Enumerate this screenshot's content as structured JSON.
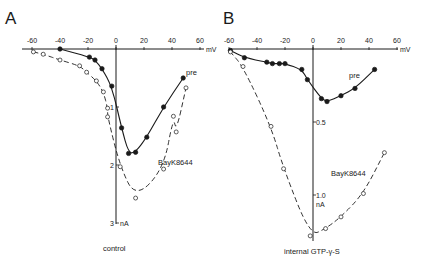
{
  "figure": {
    "panels": [
      {
        "letter": "A",
        "condition_label": "control",
        "x_unit": "mV",
        "y_unit": "nA",
        "x_ticks": [
          "-60",
          "-40",
          "-20",
          "0",
          "20",
          "40",
          "60"
        ],
        "y_ticks": [
          "1",
          "2",
          "3"
        ],
        "series_labels": {
          "pre": "pre",
          "bayk": "BayK8644"
        }
      },
      {
        "letter": "B",
        "condition_label": "internal GTP-γ-S",
        "x_unit": "mV",
        "y_unit": "nA",
        "x_ticks": [
          "-60",
          "-40",
          "-20",
          "0",
          "20",
          "40",
          "60"
        ],
        "y_ticks": [
          "0.5",
          "1.0"
        ],
        "series_labels": {
          "pre": "pre",
          "bayk": "BayK8644"
        }
      }
    ]
  },
  "chart_data": [
    {
      "type": "scatter",
      "panel": "A",
      "title": "control",
      "xlabel": "mV",
      "ylabel": "nA",
      "xlim": [
        -60,
        60
      ],
      "ylim": [
        0,
        3
      ],
      "y_inverted": true,
      "x_ticks": [
        -60,
        -40,
        -20,
        0,
        20,
        40,
        60
      ],
      "y_ticks": [
        1,
        2,
        3
      ],
      "grid": false,
      "series": [
        {
          "name": "pre",
          "marker": "filled-circle",
          "line": "solid",
          "x": [
            -40,
            -19,
            -15,
            -10,
            -3,
            4,
            9,
            14,
            22,
            34,
            48
          ],
          "y": [
            0.0,
            0.14,
            0.19,
            0.34,
            0.64,
            1.36,
            1.8,
            1.78,
            1.52,
            1.0,
            0.5
          ]
        },
        {
          "name": "BayK8644",
          "marker": "open-circle",
          "line": "dashed",
          "x": [
            -59,
            -52,
            -40,
            -26,
            -21,
            -14,
            -9,
            -6,
            -6,
            3,
            14,
            34,
            41,
            43,
            50
          ],
          "y": [
            0.05,
            0.09,
            0.19,
            0.29,
            0.4,
            0.55,
            0.74,
            1.02,
            1.17,
            2.03,
            2.57,
            2.07,
            1.16,
            1.43,
            0.67
          ]
        }
      ]
    },
    {
      "type": "scatter",
      "panel": "B",
      "title": "internal GTP-γ-S",
      "xlabel": "mV",
      "ylabel": "nA",
      "xlim": [
        -60,
        60
      ],
      "ylim": [
        0,
        1.3
      ],
      "y_inverted": true,
      "x_ticks": [
        -60,
        -40,
        -20,
        0,
        20,
        40,
        60
      ],
      "y_ticks": [
        0.5,
        1.0
      ],
      "grid": false,
      "series": [
        {
          "name": "pre",
          "marker": "filled-circle",
          "line": "solid",
          "x": [
            -59,
            -49,
            -33,
            -29,
            -24,
            -20,
            -8,
            -4,
            6,
            10,
            20,
            30,
            44
          ],
          "y": [
            0.01,
            0.06,
            0.09,
            0.1,
            0.1,
            0.1,
            0.14,
            0.21,
            0.34,
            0.36,
            0.32,
            0.27,
            0.14
          ]
        },
        {
          "name": "BayK8644",
          "marker": "open-circle",
          "line": "dashed",
          "x": [
            -59,
            -50,
            -30,
            -21,
            -2,
            9,
            20,
            36,
            51
          ],
          "y": [
            0.02,
            0.12,
            0.53,
            0.82,
            1.28,
            1.23,
            1.15,
            0.99,
            0.71
          ]
        }
      ]
    }
  ]
}
